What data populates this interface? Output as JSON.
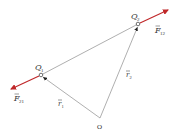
{
  "diagram": {
    "colors": {
      "line": "#9a9a9a",
      "force": "#c0282a",
      "text": "#333333",
      "background": "#ffffff"
    },
    "points": {
      "origin": {
        "label": "O",
        "x": 100,
        "y": 118
      },
      "q1": {
        "label": "Q",
        "sub": "1",
        "x": 41,
        "y": 75
      },
      "q2": {
        "label": "Q",
        "sub": "2",
        "x": 138,
        "y": 24
      }
    },
    "vectors": {
      "r1": {
        "label": "r",
        "sub": "1",
        "from": "origin",
        "to": "q1"
      },
      "r2": {
        "label": "r",
        "sub": "2",
        "from": "origin",
        "to": "q2"
      },
      "f12": {
        "label": "F",
        "sub": "12",
        "from": "q2",
        "to": [
          168,
          10
        ],
        "color": "force"
      },
      "f21": {
        "label": "F",
        "sub": "21",
        "from": "q1",
        "to": [
          11,
          89
        ],
        "color": "force"
      }
    }
  }
}
